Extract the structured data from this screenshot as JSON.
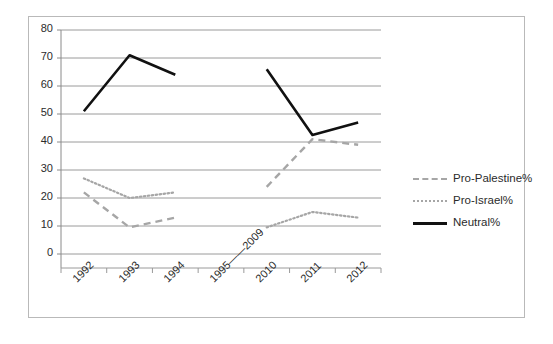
{
  "chart_data": {
    "type": "line",
    "title": "",
    "xlabel": "",
    "ylabel": "",
    "ylim": [
      0,
      80
    ],
    "ytick_step": 10,
    "yticks": [
      "0",
      "10",
      "20",
      "30",
      "40",
      "50",
      "60",
      "70",
      "80"
    ],
    "grid": true,
    "legend_position": "right",
    "categories": [
      "1992",
      "1993",
      "1994",
      "1995——2009",
      "2010",
      "2011",
      "2012"
    ],
    "series": [
      {
        "name": "Pro-Palestine%",
        "style": "dashed",
        "color": "#a6a6a6",
        "values": [
          22,
          9.5,
          13,
          null,
          24,
          41,
          39
        ]
      },
      {
        "name": "Pro-Israel%",
        "style": "dotted",
        "color": "#a6a6a6",
        "values": [
          27,
          20,
          22,
          null,
          9.5,
          15,
          13
        ]
      },
      {
        "name": "Neutral%",
        "style": "solid",
        "color": "#111111",
        "values": [
          51,
          71,
          64,
          null,
          66,
          42.5,
          47
        ]
      }
    ]
  },
  "legend": {
    "items": [
      {
        "label": "Pro-Palestine%",
        "sample": "dashed-line-swatch"
      },
      {
        "label": "Pro-Israel%",
        "sample": "dotted-line-swatch"
      },
      {
        "label": "Neutral%",
        "sample": "solid-line-swatch"
      }
    ]
  }
}
